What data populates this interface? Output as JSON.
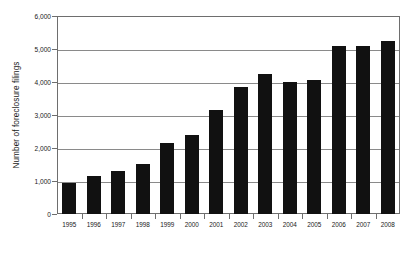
{
  "chart_data": {
    "type": "bar",
    "title": "",
    "xlabel": "",
    "ylabel": "Number of foreclosure filings",
    "categories": [
      "1995",
      "1996",
      "1997",
      "1998",
      "1999",
      "2000",
      "2001",
      "2002",
      "2003",
      "2004",
      "2005",
      "2006",
      "2007",
      "2008"
    ],
    "values": [
      950,
      1150,
      1300,
      1520,
      2150,
      2400,
      3150,
      3850,
      4250,
      4000,
      4050,
      5100,
      5100,
      5250
    ],
    "ylim": [
      0,
      6000
    ],
    "ytick_values": [
      0,
      1000,
      2000,
      3000,
      4000,
      5000,
      6000
    ],
    "ytick_labels": [
      "0",
      "1,000",
      "2,000",
      "3,000",
      "4,000",
      "5,000",
      "6,000"
    ],
    "grid": true,
    "legend": "none",
    "bar_color": "#111111",
    "grid_color": "#8a8a8a",
    "frame_color": "#6e6e6e",
    "background_color": "#ffffff"
  }
}
